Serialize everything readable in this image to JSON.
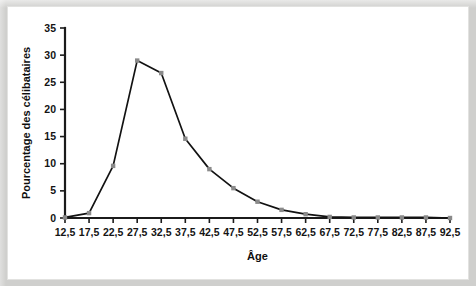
{
  "chart_data": {
    "type": "line",
    "title": "",
    "xlabel": "Âge",
    "ylabel": "Pourcentage des célibataires",
    "categories": [
      "12,5",
      "17,5",
      "22,5",
      "27,5",
      "32,5",
      "37,5",
      "42,5",
      "47,5",
      "52,5",
      "57,5",
      "62,5",
      "67,5",
      "72,5",
      "77,5",
      "82,5",
      "87,5",
      "92,5"
    ],
    "x": [
      12.5,
      17.5,
      22.5,
      27.5,
      32.5,
      37.5,
      42.5,
      47.5,
      52.5,
      57.5,
      62.5,
      67.5,
      72.5,
      77.5,
      82.5,
      87.5,
      92.5
    ],
    "values": [
      0.1,
      0.9,
      9.6,
      29.0,
      26.7,
      14.6,
      9.0,
      5.5,
      3.0,
      1.5,
      0.7,
      0.2,
      0.1,
      0.1,
      0.1,
      0.1,
      0.0
    ],
    "series": [
      {
        "name": "Pourcentage des célibataires",
        "values": [
          0.1,
          0.9,
          9.6,
          29.0,
          26.7,
          14.6,
          9.0,
          5.5,
          3.0,
          1.5,
          0.7,
          0.2,
          0.1,
          0.1,
          0.1,
          0.1,
          0.0
        ]
      }
    ],
    "ytick_labels": [
      "0",
      "5",
      "10",
      "15",
      "20",
      "25",
      "30",
      "35"
    ],
    "yticks": [
      0,
      5,
      10,
      15,
      20,
      25,
      30,
      35
    ],
    "ylim": [
      0,
      35
    ],
    "xlim": [
      12.5,
      92.5
    ],
    "grid": false,
    "legend": false,
    "marker": "square",
    "line_color": "#121212",
    "marker_color": "#8a8a8a",
    "background_color": "#ffffff",
    "page_color": "#cfcfcd"
  }
}
